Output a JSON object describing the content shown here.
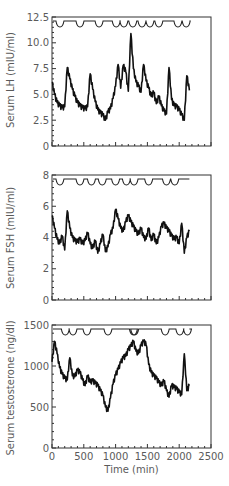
{
  "chart_data": [
    {
      "type": "line",
      "title": "",
      "xlabel": "",
      "ylabel": "Serum LH (mIU/ml)",
      "ylim": [
        0,
        12.5
      ],
      "xlim": [
        0,
        2500
      ],
      "yticks": [
        "0",
        "2.5",
        "5.0",
        "7.5",
        "10.0",
        "12.5"
      ],
      "ytick_values": [
        0,
        2.5,
        5.0,
        7.5,
        10.0,
        12.5
      ],
      "grid": false,
      "series": [
        {
          "name": "LH",
          "x": [
            0,
            40,
            80,
            120,
            160,
            200,
            240,
            280,
            320,
            360,
            400,
            440,
            480,
            520,
            560,
            600,
            640,
            680,
            720,
            760,
            800,
            840,
            880,
            920,
            960,
            1000,
            1040,
            1080,
            1120,
            1160,
            1200,
            1240,
            1280,
            1320,
            1360,
            1400,
            1440,
            1480,
            1520,
            1560,
            1600,
            1640,
            1680,
            1720,
            1760,
            1800,
            1840,
            1880,
            1920,
            1960,
            2000,
            2040,
            2080,
            2120,
            2160
          ],
          "values": [
            6.2,
            5.0,
            4.2,
            3.9,
            3.7,
            3.8,
            7.6,
            6.5,
            5.5,
            4.8,
            4.2,
            3.9,
            3.7,
            3.6,
            3.8,
            7.0,
            5.5,
            4.3,
            3.5,
            3.2,
            3.0,
            2.5,
            3.3,
            3.6,
            4.6,
            5.8,
            7.9,
            5.6,
            7.8,
            7.2,
            5.3,
            10.9,
            7.5,
            6.2,
            5.8,
            5.2,
            7.9,
            6.3,
            5.6,
            4.8,
            5.2,
            4.1,
            4.8,
            3.9,
            3.4,
            3.1,
            7.6,
            4.5,
            3.9,
            3.8,
            3.5,
            3.0,
            2.5,
            6.8,
            5.4
          ]
        }
      ],
      "event_markers_min": [
        125,
        440,
        740,
        1010,
        1130,
        1270,
        1415,
        1540,
        1680,
        1980,
        2110
      ]
    },
    {
      "type": "line",
      "title": "",
      "xlabel": "",
      "ylabel": "Serum FSH (mIU/ml)",
      "ylim": [
        0,
        8
      ],
      "xlim": [
        0,
        2500
      ],
      "yticks": [
        "0",
        "2",
        "4",
        "6",
        "8"
      ],
      "ytick_values": [
        0,
        2,
        4,
        6,
        8
      ],
      "grid": false,
      "series": [
        {
          "name": "FSH",
          "x": [
            0,
            40,
            80,
            120,
            160,
            200,
            240,
            280,
            320,
            360,
            400,
            440,
            480,
            520,
            560,
            600,
            640,
            680,
            720,
            760,
            800,
            840,
            880,
            920,
            960,
            1000,
            1040,
            1080,
            1120,
            1160,
            1200,
            1240,
            1280,
            1320,
            1360,
            1400,
            1440,
            1480,
            1520,
            1560,
            1600,
            1640,
            1680,
            1720,
            1760,
            1800,
            1840,
            1880,
            1920,
            1960,
            2000,
            2040,
            2080,
            2120,
            2160
          ],
          "values": [
            5.4,
            4.6,
            3.9,
            3.6,
            4.1,
            3.2,
            5.7,
            4.6,
            4.0,
            3.8,
            3.7,
            3.9,
            3.6,
            3.8,
            4.3,
            3.6,
            3.3,
            3.8,
            3.0,
            3.6,
            4.2,
            3.1,
            3.4,
            4.2,
            4.6,
            5.8,
            5.2,
            4.6,
            4.4,
            5.0,
            5.4,
            5.0,
            4.7,
            4.4,
            4.2,
            4.6,
            4.0,
            3.9,
            4.6,
            3.8,
            4.2,
            3.6,
            4.0,
            4.7,
            4.9,
            4.6,
            4.4,
            4.1,
            3.9,
            4.0,
            3.6,
            4.9,
            3.0,
            4.0,
            4.4
          ]
        }
      ],
      "event_markers_min": [
        125,
        440,
        620,
        790,
        1000,
        1170,
        1290,
        1520,
        1800,
        1930
      ]
    },
    {
      "type": "line",
      "title": "",
      "xlabel": "Time (min)",
      "ylabel": "Serum testosterone (ng/dl)",
      "ylim": [
        0,
        1500
      ],
      "xlim": [
        0,
        2500
      ],
      "yticks": [
        "0",
        "500",
        "1000",
        "1500"
      ],
      "ytick_values": [
        0,
        500,
        1000,
        1500
      ],
      "xticks": [
        "0",
        "500",
        "1000",
        "1500",
        "2000",
        "2500"
      ],
      "xtick_values": [
        0,
        500,
        1000,
        1500,
        2000,
        2500
      ],
      "grid": false,
      "series": [
        {
          "name": "Testosterone",
          "x": [
            0,
            40,
            80,
            120,
            160,
            200,
            240,
            280,
            320,
            360,
            400,
            440,
            480,
            520,
            560,
            600,
            640,
            680,
            720,
            760,
            800,
            840,
            880,
            920,
            960,
            1000,
            1040,
            1080,
            1120,
            1160,
            1200,
            1240,
            1280,
            1320,
            1360,
            1400,
            1440,
            1480,
            1520,
            1560,
            1600,
            1640,
            1680,
            1720,
            1760,
            1800,
            1840,
            1880,
            1920,
            1960,
            2000,
            2040,
            2080,
            2120,
            2160
          ],
          "values": [
            1050,
            1300,
            1150,
            980,
            900,
            850,
            830,
            1100,
            880,
            870,
            950,
            920,
            830,
            760,
            880,
            800,
            820,
            790,
            760,
            700,
            640,
            500,
            450,
            610,
            780,
            890,
            960,
            1040,
            1100,
            1120,
            1200,
            1240,
            1300,
            1180,
            1150,
            1250,
            1300,
            1260,
            1020,
            920,
            880,
            850,
            800,
            760,
            820,
            700,
            620,
            760,
            740,
            720,
            680,
            650,
            1150,
            700,
            760
          ]
        }
      ],
      "event_markers_min": [
        210,
        330,
        550,
        880,
        1280,
        1300,
        1780,
        2010,
        2130
      ]
    }
  ]
}
